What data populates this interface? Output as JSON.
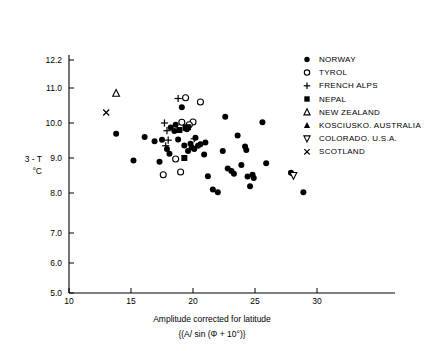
{
  "chart_data": {
    "type": "scatter",
    "title": "",
    "xlabel": "Amplitude corrected for latitude",
    "xlabel2": "{(A/ sin (Φ + 10°)}",
    "ylabel_line1": "3 - T",
    "ylabel_line2": "°C",
    "xlim": [
      10,
      33
    ],
    "ylim": [
      5.0,
      12.6
    ],
    "xticks": [
      10,
      15,
      20,
      25,
      30
    ],
    "xtick_labels": [
      "10",
      "15",
      "20",
      "25",
      "30"
    ],
    "yticks": [
      5.0,
      6.0,
      7.0,
      8.0,
      9.0,
      10.0,
      11.0,
      12.2
    ],
    "ytick_labels": [
      "5.0",
      "6.0",
      "7.0",
      "8.0",
      "9.0",
      "10.0",
      "11.0",
      "12.2"
    ],
    "grid": false,
    "legend_position": "top-right",
    "series": [
      {
        "name": "NORWAY",
        "marker": "filled-circle",
        "points": [
          [
            13.8,
            9.69
          ],
          [
            15.2,
            8.93
          ],
          [
            16.1,
            9.6
          ],
          [
            17.3,
            8.89
          ],
          [
            17.5,
            9.52
          ],
          [
            17.9,
            9.26
          ],
          [
            18.2,
            9.87
          ],
          [
            18.5,
            9.77
          ],
          [
            18.6,
            9.95
          ],
          [
            18.8,
            9.53
          ],
          [
            19.1,
            10.45
          ],
          [
            19.3,
            9.36
          ],
          [
            19.5,
            9.82
          ],
          [
            19.8,
            9.41
          ],
          [
            19.9,
            9.3
          ],
          [
            20.1,
            9.26
          ],
          [
            20.2,
            9.58
          ],
          [
            20.4,
            9.35
          ],
          [
            20.6,
            9.39
          ],
          [
            21.0,
            9.44
          ],
          [
            21.2,
            8.48
          ],
          [
            21.6,
            8.1
          ],
          [
            22.0,
            8.02
          ],
          [
            22.4,
            9.2
          ],
          [
            22.6,
            10.18
          ],
          [
            22.8,
            8.7
          ],
          [
            23.3,
            8.55
          ],
          [
            23.6,
            9.64
          ],
          [
            23.9,
            8.8
          ],
          [
            24.2,
            9.33
          ],
          [
            24.3,
            9.23
          ],
          [
            24.4,
            8.47
          ],
          [
            24.6,
            8.19
          ],
          [
            24.8,
            8.52
          ],
          [
            24.9,
            8.43
          ],
          [
            25.6,
            10.02
          ],
          [
            25.9,
            8.85
          ],
          [
            27.9,
            8.58
          ],
          [
            28.9,
            8.02
          ],
          [
            18.1,
            9.12
          ],
          [
            19.6,
            9.2
          ],
          [
            20.9,
            9.1
          ],
          [
            16.9,
            9.48
          ],
          [
            23.1,
            8.63
          ]
        ]
      },
      {
        "name": "TYROL",
        "marker": "open-circle",
        "points": [
          [
            19.4,
            10.72
          ],
          [
            20.6,
            10.6
          ],
          [
            19.1,
            10.02
          ],
          [
            20.0,
            10.03
          ],
          [
            19.7,
            9.95
          ],
          [
            17.6,
            8.52
          ],
          [
            19.0,
            8.6
          ],
          [
            18.6,
            8.97
          ]
        ]
      },
      {
        "name": "FRENCH ALPS",
        "marker": "plus",
        "points": [
          [
            18.8,
            10.7
          ],
          [
            17.7,
            10.0
          ],
          [
            17.9,
            9.78
          ],
          [
            18.0,
            9.51
          ],
          [
            17.8,
            9.35
          ],
          [
            20.1,
            9.55
          ]
        ]
      },
      {
        "name": "NEPAL",
        "marker": "filled-square",
        "points": [
          [
            19.4,
            9.86
          ],
          [
            19.6,
            9.88
          ],
          [
            18.9,
            9.8
          ],
          [
            19.3,
            9.0
          ]
        ]
      },
      {
        "name": "NEW ZEALAND",
        "marker": "open-triangle-up",
        "points": [
          [
            13.8,
            10.85
          ]
        ]
      },
      {
        "name": "KOSCIUSKO. AUSTRALIA",
        "marker": "filled-triangle-up",
        "points": []
      },
      {
        "name": "COLORADO. U.S.A.",
        "marker": "open-triangle-down",
        "points": [
          [
            28.1,
            8.5
          ]
        ]
      },
      {
        "name": "SCOTLAND",
        "marker": "cross-x",
        "points": [
          [
            13.0,
            10.3
          ]
        ]
      }
    ],
    "legend": [
      {
        "label": "NORWAY",
        "marker": "filled-circle"
      },
      {
        "label": "TYROL",
        "marker": "open-circle"
      },
      {
        "label": "FRENCH ALPS",
        "marker": "plus"
      },
      {
        "label": "NEPAL",
        "marker": "filled-square"
      },
      {
        "label": "NEW ZEALAND",
        "marker": "open-triangle-up"
      },
      {
        "label": "KOSCIUSKO. AUSTRALIA",
        "marker": "filled-triangle-up"
      },
      {
        "label": "COLORADO. U.S.A.",
        "marker": "open-triangle-down"
      },
      {
        "label": "SCOTLAND",
        "marker": "cross-x"
      }
    ],
    "colors": {
      "ink": "#000000",
      "background": "#ffffff"
    }
  }
}
